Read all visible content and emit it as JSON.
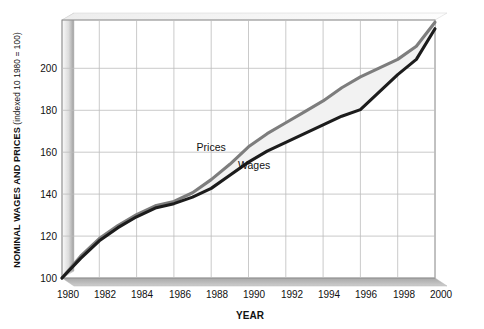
{
  "chart_data": {
    "type": "line",
    "title": "",
    "xlabel": "YEAR",
    "ylabel": "NOMINAL WAGES AND PRICES",
    "ylabel_note": "(indexed 10 1980 = 100)",
    "xlim": [
      1980,
      2000
    ],
    "ylim": [
      100,
      218
    ],
    "yticks": [
      100,
      120,
      140,
      160,
      180,
      200
    ],
    "xticks": [
      1980,
      1982,
      1984,
      1986,
      1988,
      1990,
      1992,
      1994,
      1996,
      1998,
      2000
    ],
    "grid": true,
    "legend_position": "inline-annotation",
    "x": [
      1980,
      1981,
      1982,
      1983,
      1984,
      1985,
      1986,
      1987,
      1988,
      1989,
      1990,
      1991,
      1992,
      1993,
      1994,
      1995,
      1996,
      1997,
      1998,
      1999,
      2000
    ],
    "series": [
      {
        "name": "Prices",
        "color": "#7d7d7d",
        "values": [
          100,
          110,
          118,
          124,
          129,
          133,
          135,
          139,
          145,
          152,
          160,
          166,
          171,
          176,
          181,
          187,
          192,
          196,
          200,
          206,
          217
        ]
      },
      {
        "name": "Wages",
        "color": "#1c1c1c",
        "values": [
          100,
          109,
          117,
          123,
          128,
          132,
          134,
          137,
          141,
          147,
          153,
          158,
          162,
          166,
          170,
          174,
          177,
          185,
          193,
          200,
          214
        ]
      }
    ],
    "annotations": [
      {
        "text": "Prices",
        "x": 1988,
        "y": 158
      },
      {
        "text": "Wages",
        "x": 1990.3,
        "y": 150
      }
    ],
    "fill_between": {
      "upper": "Prices",
      "lower": "Wages",
      "color": "#f2f2f2"
    }
  },
  "axis": {
    "y_tick_labels": [
      "200",
      "180",
      "160",
      "140",
      "120",
      "100"
    ],
    "x_tick_labels": [
      "1980",
      "1982",
      "1984",
      "1986",
      "1988",
      "1990",
      "1992",
      "1994",
      "1996",
      "1998",
      "2000"
    ],
    "x_title": "YEAR",
    "y_title_main": "NOMINAL WAGES AND PRICES",
    "y_title_sub": " (indexed 10 1980 = 100)"
  },
  "labels": {
    "prices": "Prices",
    "wages": "Wages"
  },
  "colors": {
    "prices_line": "#7d7d7d",
    "wages_line": "#1c1c1c",
    "band_fill": "#f2f2f2",
    "grid": "#b9b9b9",
    "frame": "#8a8a8a",
    "floor": "#b0b0b0",
    "wall_light": "#f0f0f0",
    "wall_dark": "#9a9a9a",
    "text": "#111111"
  }
}
